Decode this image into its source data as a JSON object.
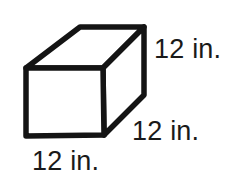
{
  "figure": {
    "name": "cube",
    "stroke_color": "#141414",
    "fill_color": "#ffffff",
    "background_color": "#ffffff",
    "stroke_width": 5.5,
    "vertices": {
      "front_top_left": [
        26,
        68
      ],
      "front_top_right": [
        103,
        68
      ],
      "front_bottom_right": [
        104,
        135
      ],
      "front_bottom_left": [
        26,
        136
      ],
      "back_top_left": [
        80,
        27
      ],
      "back_top_right": [
        144,
        27
      ],
      "back_bottom_right": [
        144,
        95
      ]
    }
  },
  "labels": {
    "height": {
      "text": "12 in.",
      "value": 12,
      "unit": "in.",
      "edge": "vertical-right-height"
    },
    "depth": {
      "text": "12 in.",
      "value": 12,
      "unit": "in.",
      "edge": "diagonal-depth"
    },
    "width": {
      "text": "12 in.",
      "value": 12,
      "unit": "in.",
      "edge": "bottom-front-width"
    }
  }
}
